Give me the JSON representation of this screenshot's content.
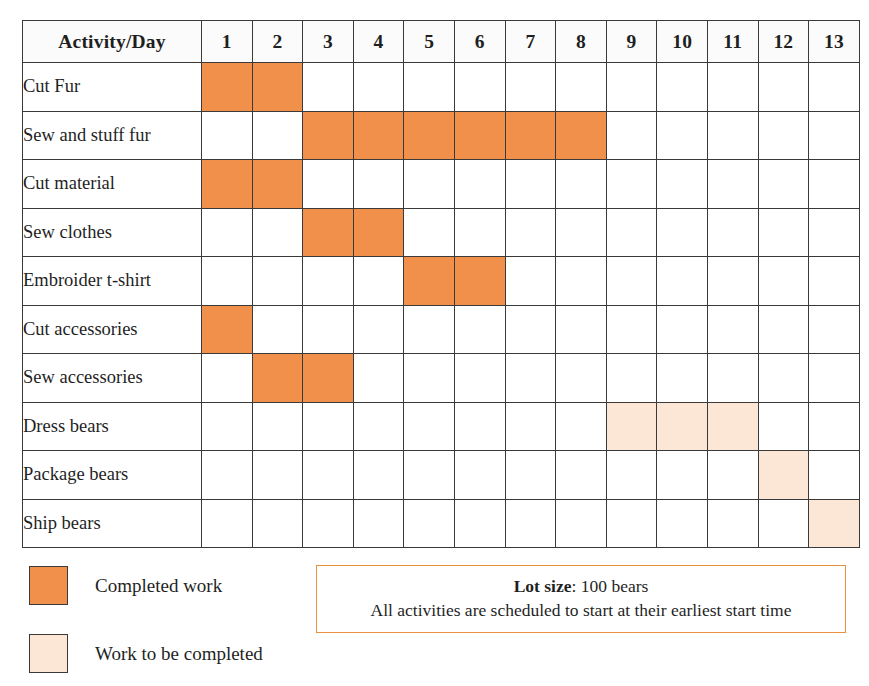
{
  "table": {
    "corner_label": "Activity/Day",
    "day_headers": [
      "1",
      "2",
      "3",
      "4",
      "5",
      "6",
      "7",
      "8",
      "9",
      "10",
      "11",
      "12",
      "13"
    ],
    "rows": [
      {
        "label": "Cut Fur",
        "cells": [
          "done",
          "done",
          "none",
          "none",
          "none",
          "none",
          "none",
          "none",
          "none",
          "none",
          "none",
          "none",
          "none"
        ]
      },
      {
        "label": "Sew and stuff fur",
        "cells": [
          "none",
          "none",
          "done",
          "done",
          "done",
          "done",
          "done",
          "done",
          "none",
          "none",
          "none",
          "none",
          "none"
        ]
      },
      {
        "label": "Cut material",
        "cells": [
          "done",
          "done",
          "none",
          "none",
          "none",
          "none",
          "none",
          "none",
          "none",
          "none",
          "none",
          "none",
          "none"
        ]
      },
      {
        "label": "Sew clothes",
        "cells": [
          "none",
          "none",
          "done",
          "done",
          "none",
          "none",
          "none",
          "none",
          "none",
          "none",
          "none",
          "none",
          "none"
        ]
      },
      {
        "label": "Embroider t-shirt",
        "cells": [
          "none",
          "none",
          "none",
          "none",
          "done",
          "done",
          "none",
          "none",
          "none",
          "none",
          "none",
          "none",
          "none"
        ]
      },
      {
        "label": "Cut accessories",
        "cells": [
          "done",
          "none",
          "none",
          "none",
          "none",
          "none",
          "none",
          "none",
          "none",
          "none",
          "none",
          "none",
          "none"
        ]
      },
      {
        "label": "Sew accessories",
        "cells": [
          "none",
          "done",
          "done",
          "none",
          "none",
          "none",
          "none",
          "none",
          "none",
          "none",
          "none",
          "none",
          "none"
        ]
      },
      {
        "label": "Dress bears",
        "cells": [
          "none",
          "none",
          "none",
          "none",
          "none",
          "none",
          "none",
          "none",
          "todo",
          "todo",
          "todo",
          "none",
          "none"
        ]
      },
      {
        "label": "Package bears",
        "cells": [
          "none",
          "none",
          "none",
          "none",
          "none",
          "none",
          "none",
          "none",
          "none",
          "none",
          "none",
          "todo",
          "none"
        ]
      },
      {
        "label": "Ship bears",
        "cells": [
          "none",
          "none",
          "none",
          "none",
          "none",
          "none",
          "none",
          "none",
          "none",
          "none",
          "none",
          "none",
          "todo"
        ]
      }
    ]
  },
  "legend": {
    "items": [
      {
        "state": "done",
        "label": "Completed work",
        "color": "#F1904B"
      },
      {
        "state": "todo",
        "label": "Work to be completed",
        "color": "#FCE6D5"
      }
    ]
  },
  "note": {
    "line1_strong": "Lot size",
    "line1_rest": ": 100 bears",
    "line2": "All activities are scheduled to start at their earliest start time",
    "border_color": "#E8913E"
  },
  "chart_data": {
    "type": "bar",
    "xlabel": "Day",
    "ylabel": "Activity",
    "x": [
      1,
      2,
      3,
      4,
      5,
      6,
      7,
      8,
      9,
      10,
      11,
      12,
      13
    ],
    "xlim": [
      1,
      13
    ],
    "categories": [
      "Cut Fur",
      "Sew and stuff fur",
      "Cut material",
      "Sew clothes",
      "Embroider t-shirt",
      "Cut accessories",
      "Sew accessories",
      "Dress bears",
      "Package bears",
      "Ship bears"
    ],
    "grid": true,
    "legend_position": "bottom-left",
    "series": [
      {
        "name": "Completed work",
        "color": "#F1904B",
        "bars": [
          {
            "activity": "Cut Fur",
            "start_day": 1,
            "end_day": 2,
            "duration": 2
          },
          {
            "activity": "Sew and stuff fur",
            "start_day": 3,
            "end_day": 8,
            "duration": 6
          },
          {
            "activity": "Cut material",
            "start_day": 1,
            "end_day": 2,
            "duration": 2
          },
          {
            "activity": "Sew clothes",
            "start_day": 3,
            "end_day": 4,
            "duration": 2
          },
          {
            "activity": "Embroider t-shirt",
            "start_day": 5,
            "end_day": 6,
            "duration": 2
          },
          {
            "activity": "Cut accessories",
            "start_day": 1,
            "end_day": 1,
            "duration": 1
          },
          {
            "activity": "Sew accessories",
            "start_day": 2,
            "end_day": 3,
            "duration": 2
          }
        ]
      },
      {
        "name": "Work to be completed",
        "color": "#FCE6D5",
        "bars": [
          {
            "activity": "Dress bears",
            "start_day": 9,
            "end_day": 11,
            "duration": 3
          },
          {
            "activity": "Package bears",
            "start_day": 12,
            "end_day": 12,
            "duration": 1
          },
          {
            "activity": "Ship bears",
            "start_day": 13,
            "end_day": 13,
            "duration": 1
          }
        ]
      }
    ],
    "annotations": [
      "Lot size: 100 bears",
      "All activities are scheduled to start at their earliest start time"
    ]
  }
}
